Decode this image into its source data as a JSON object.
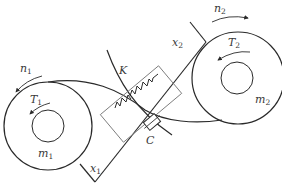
{
  "diagram": {
    "type": "two-mass belt drive with spring-damper coupling",
    "colors": {
      "stroke": "#2a2a2a",
      "thin_stroke": "#7a7a7a",
      "label": "#3a3a3a",
      "background": "#ffffff"
    },
    "labels": {
      "n1": {
        "main": "n",
        "sub": "1"
      },
      "T1": {
        "main": "T",
        "sub": "1"
      },
      "m1": {
        "main": "m",
        "sub": "1"
      },
      "x1": {
        "main": "x",
        "sub": "1"
      },
      "n2": {
        "main": "n",
        "sub": "2"
      },
      "T2": {
        "main": "T",
        "sub": "2"
      },
      "m2": {
        "main": "m",
        "sub": "2"
      },
      "x2": {
        "main": "x",
        "sub": "2"
      },
      "K": {
        "main": "K"
      },
      "C": {
        "main": "C"
      }
    },
    "components": [
      {
        "id": "pulley-1",
        "mass": "m1",
        "torque": "T1",
        "speed": "n1"
      },
      {
        "id": "pulley-2",
        "mass": "m2",
        "torque": "T2",
        "speed": "n2"
      },
      {
        "id": "spring",
        "label": "K"
      },
      {
        "id": "damper",
        "label": "C"
      }
    ]
  }
}
